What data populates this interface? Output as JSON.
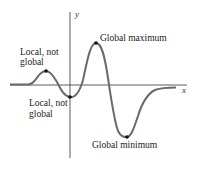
{
  "diagram": {
    "axes": {
      "x_label": "x",
      "y_label": "y",
      "axis_color": "#333333"
    },
    "curve": {
      "color": "#666666"
    },
    "points": [
      {
        "id": "local-max",
        "label_lines": [
          "Local, not",
          "global"
        ],
        "x": 46,
        "y": 71
      },
      {
        "id": "local-min",
        "label_lines": [
          "Local, not",
          "global"
        ],
        "x": 70,
        "y": 97
      },
      {
        "id": "global-max",
        "label_lines": [
          "Global maximum"
        ],
        "x": 96,
        "y": 43
      },
      {
        "id": "global-min",
        "label_lines": [
          "Global minimum"
        ],
        "x": 127,
        "y": 137
      }
    ],
    "labels": {
      "local_max_line1": "Local, not",
      "local_max_line2": "global",
      "local_min_line1": "Local, not",
      "local_min_line2": "global",
      "global_max": "Global maximum",
      "global_min": "Global minimum"
    }
  }
}
